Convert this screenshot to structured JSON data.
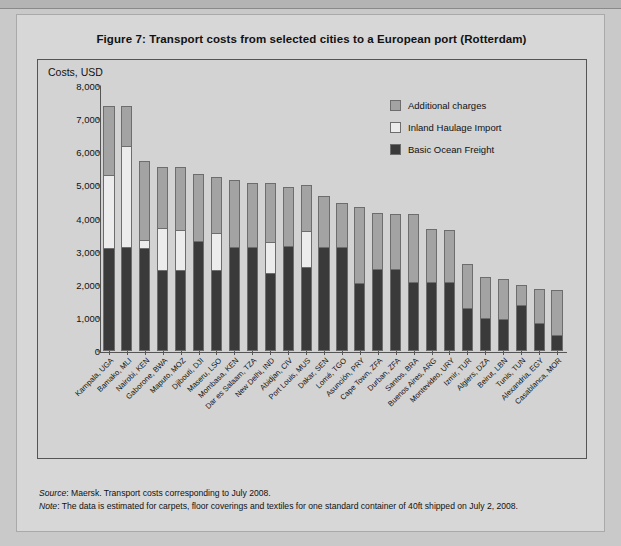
{
  "figure": {
    "title": "Figure 7:  Transport costs from selected cities to a European port (Rotterdam)",
    "y_axis_title": "Costs, USD"
  },
  "legend": {
    "position": "top-right",
    "items": [
      {
        "label": "Additional charges",
        "color": "#a3a3a3",
        "name": "additional-charges"
      },
      {
        "label": "Inland Haulage Import",
        "color": "#ececec",
        "name": "inland-haulage-import"
      },
      {
        "label": "Basic Ocean Freight",
        "color": "#3a3a3a",
        "name": "basic-ocean-freight"
      }
    ]
  },
  "notes": {
    "source_label": "Source",
    "source_text": ": Maersk. Transport costs corresponding to July 2008.",
    "note_label": "Note",
    "note_text": ": The data is estimated for carpets, floor coverings and textiles for one standard container of 40ft shipped on July 2, 2008."
  },
  "chart_data": {
    "type": "bar",
    "stacked": true,
    "title": "Figure 7:  Transport costs from selected cities to a European port (Rotterdam)",
    "xlabel": "",
    "ylabel": "Costs, USD",
    "ylim": [
      0,
      8000
    ],
    "yticks": [
      "0",
      "1,000",
      "2,000",
      "3,000",
      "4,000",
      "5,000",
      "6,000",
      "7,000",
      "8,000"
    ],
    "ytick_values": [
      0,
      1000,
      2000,
      3000,
      4000,
      5000,
      6000,
      7000,
      8000
    ],
    "grid": false,
    "legend_position": "top-right",
    "categories": [
      "Kampala, UGA",
      "Bamako, MLI",
      "Nairobi, KEN",
      "Gaborone, BWA",
      "Maputo, MOZ",
      "Djibouti, DJI",
      "Maseru, LSO",
      "Mombasa, KEN",
      "Dar es Salaam, TZA",
      "New Delhi, IND",
      "Abidjan, CIV",
      "Port Louis, MUS",
      "Dakar, SEN",
      "Lomé, TGO",
      "Asunción, PRY",
      "Cape Town, ZFA",
      "Durban, ZFA",
      "Santos, BRA",
      "Buenos Aires, ARG",
      "Montevideo, URY",
      "Izmir, TUR",
      "Algiers, DZA",
      "Beirut, LBN",
      "Tunis, TUN",
      "Alexandria, EGY",
      "Casablanca, MOR"
    ],
    "series": [
      {
        "name": "Basic Ocean Freight",
        "color": "#3a3a3a",
        "values": [
          3050,
          3080,
          3050,
          2400,
          2390,
          3250,
          2400,
          3080,
          3080,
          2300,
          3100,
          2480,
          3080,
          3080,
          2000,
          2420,
          2420,
          2020,
          2010,
          2010,
          1240,
          940,
          910,
          1330,
          800,
          430
        ]
      },
      {
        "name": "Inland Haulage Import",
        "color": "#ececec",
        "values": [
          2200,
          3050,
          250,
          1250,
          1210,
          0,
          1110,
          0,
          0,
          930,
          0,
          1070,
          0,
          0,
          0,
          0,
          0,
          0,
          0,
          0,
          0,
          0,
          0,
          0,
          0,
          0
        ]
      },
      {
        "name": "Additional charges",
        "color": "#a3a3a3",
        "values": [
          2100,
          1220,
          2370,
          1850,
          1900,
          2020,
          1690,
          2030,
          1940,
          1770,
          1790,
          1410,
          1540,
          1320,
          2290,
          1680,
          1670,
          2070,
          1600,
          1590,
          1320,
          1240,
          1200,
          590,
          1020,
          1350
        ]
      }
    ],
    "totals": [
      7350,
      7350,
      5670,
      5500,
      5500,
      5270,
      5200,
      5110,
      5020,
      5000,
      4890,
      4960,
      4620,
      4400,
      4290,
      4100,
      4090,
      4090,
      3610,
      3600,
      2560,
      2180,
      2110,
      1920,
      1820,
      1780
    ]
  }
}
